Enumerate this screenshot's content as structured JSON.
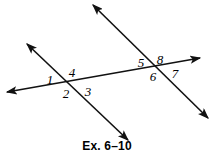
{
  "figure": {
    "caption": "Ex. 6–10",
    "stroke_color": "#111111",
    "background_color": "#ffffff",
    "stroke_width": 1.6,
    "width": 214,
    "height": 156,
    "lines": [
      {
        "name": "transversal-line",
        "description": "long nearly-horizontal line crossing both parallel lines",
        "x1": 7,
        "y1": 92,
        "x2": 200,
        "y2": 58,
        "arrow_start": true,
        "arrow_end": true
      },
      {
        "name": "left-diagonal-line",
        "description": "left diagonal line through intersection with angles 1,2,3,4",
        "x1": 27,
        "y1": 44,
        "x2": 128,
        "y2": 140,
        "arrow_start": true,
        "arrow_end": true
      },
      {
        "name": "right-diagonal-line",
        "description": "right diagonal line through intersection with angles 5,6,7,8",
        "x1": 93,
        "y1": 5,
        "x2": 208,
        "y2": 118,
        "arrow_start": true,
        "arrow_end": true
      }
    ],
    "intersections": [
      {
        "name": "left-intersection",
        "x": 70,
        "y": 80
      },
      {
        "name": "right-intersection",
        "x": 156,
        "y": 66
      }
    ],
    "angle_labels": [
      {
        "id": "1",
        "text": "1",
        "x": 50,
        "y": 79
      },
      {
        "id": "2",
        "text": "2",
        "x": 66,
        "y": 93
      },
      {
        "id": "3",
        "text": "3",
        "x": 88,
        "y": 91
      },
      {
        "id": "4",
        "text": "4",
        "x": 72,
        "y": 72
      },
      {
        "id": "5",
        "text": "5",
        "x": 141,
        "y": 62
      },
      {
        "id": "6",
        "text": "6",
        "x": 153,
        "y": 76
      },
      {
        "id": "7",
        "text": "7",
        "x": 175,
        "y": 73
      },
      {
        "id": "8",
        "text": "8",
        "x": 160,
        "y": 59
      }
    ]
  }
}
